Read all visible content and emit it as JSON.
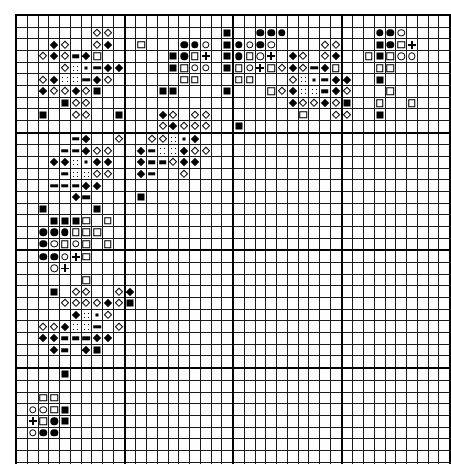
{
  "chart_data": {
    "type": "heatmap",
    "title": "",
    "xlabel": "",
    "ylabel": "",
    "grid": {
      "columns": 40,
      "rows": 40,
      "cell_px": 10.55,
      "major_rule_every": 10
    },
    "legend": [
      {
        "key": "fsq",
        "symbol_name": "filled-square",
        "glyph": "■"
      },
      {
        "key": "osq",
        "symbol_name": "open-square",
        "glyph": "□"
      },
      {
        "key": "fci",
        "symbol_name": "filled-circle",
        "glyph": "●"
      },
      {
        "key": "oci",
        "symbol_name": "open-circle",
        "glyph": "○"
      },
      {
        "key": "fdi",
        "symbol_name": "filled-diamond",
        "glyph": "◆"
      },
      {
        "key": "odi",
        "symbol_name": "open-diamond",
        "glyph": "◇"
      },
      {
        "key": "bar",
        "symbol_name": "horizontal-bar",
        "glyph": "▬"
      },
      {
        "key": "dot",
        "symbol_name": "small-dot",
        "glyph": "·"
      },
      {
        "key": "plu",
        "symbol_name": "plus-sign",
        "glyph": "+"
      },
      {
        "key": "stp",
        "symbol_name": "stippled-square",
        "glyph": "∷"
      }
    ],
    "cells": [
      {
        "r": 1,
        "c": 7,
        "s": "odi"
      },
      {
        "r": 1,
        "c": 8,
        "s": "odi"
      },
      {
        "r": 1,
        "c": 19,
        "s": "fsq"
      },
      {
        "r": 1,
        "c": 22,
        "s": "fci"
      },
      {
        "r": 1,
        "c": 23,
        "s": "fci"
      },
      {
        "r": 1,
        "c": 24,
        "s": "fci"
      },
      {
        "r": 1,
        "c": 33,
        "s": "fci"
      },
      {
        "r": 1,
        "c": 34,
        "s": "fci"
      },
      {
        "r": 1,
        "c": 35,
        "s": "oci"
      },
      {
        "r": 2,
        "c": 3,
        "s": "fdi"
      },
      {
        "r": 2,
        "c": 4,
        "s": "odi"
      },
      {
        "r": 2,
        "c": 7,
        "s": "odi"
      },
      {
        "r": 2,
        "c": 8,
        "s": "fdi"
      },
      {
        "r": 2,
        "c": 11,
        "s": "osq"
      },
      {
        "r": 2,
        "c": 15,
        "s": "fci"
      },
      {
        "r": 2,
        "c": 16,
        "s": "fci"
      },
      {
        "r": 2,
        "c": 17,
        "s": "oci"
      },
      {
        "r": 2,
        "c": 19,
        "s": "fsq"
      },
      {
        "r": 2,
        "c": 20,
        "s": "fci"
      },
      {
        "r": 2,
        "c": 21,
        "s": "oci"
      },
      {
        "r": 2,
        "c": 22,
        "s": "fci"
      },
      {
        "r": 2,
        "c": 23,
        "s": "oci"
      },
      {
        "r": 2,
        "c": 28,
        "s": "odi"
      },
      {
        "r": 2,
        "c": 29,
        "s": "odi"
      },
      {
        "r": 2,
        "c": 33,
        "s": "fsq"
      },
      {
        "r": 2,
        "c": 34,
        "s": "fci"
      },
      {
        "r": 2,
        "c": 35,
        "s": "osq"
      },
      {
        "r": 2,
        "c": 36,
        "s": "plu"
      },
      {
        "r": 3,
        "c": 2,
        "s": "odi"
      },
      {
        "r": 3,
        "c": 3,
        "s": "fdi"
      },
      {
        "r": 3,
        "c": 4,
        "s": "odi"
      },
      {
        "r": 3,
        "c": 5,
        "s": "bar"
      },
      {
        "r": 3,
        "c": 6,
        "s": "fdi"
      },
      {
        "r": 3,
        "c": 7,
        "s": "osq"
      },
      {
        "r": 3,
        "c": 14,
        "s": "fsq"
      },
      {
        "r": 3,
        "c": 15,
        "s": "fci"
      },
      {
        "r": 3,
        "c": 16,
        "s": "osq"
      },
      {
        "r": 3,
        "c": 17,
        "s": "plu"
      },
      {
        "r": 3,
        "c": 19,
        "s": "fsq"
      },
      {
        "r": 3,
        "c": 20,
        "s": "fci"
      },
      {
        "r": 3,
        "c": 21,
        "s": "osq"
      },
      {
        "r": 3,
        "c": 22,
        "s": "oci"
      },
      {
        "r": 3,
        "c": 23,
        "s": "plu"
      },
      {
        "r": 3,
        "c": 25,
        "s": "fdi"
      },
      {
        "r": 3,
        "c": 26,
        "s": "odi"
      },
      {
        "r": 3,
        "c": 28,
        "s": "odi"
      },
      {
        "r": 3,
        "c": 29,
        "s": "fdi"
      },
      {
        "r": 3,
        "c": 32,
        "s": "osq"
      },
      {
        "r": 3,
        "c": 33,
        "s": "fsq"
      },
      {
        "r": 3,
        "c": 34,
        "s": "osq"
      },
      {
        "r": 3,
        "c": 35,
        "s": "oci"
      },
      {
        "r": 3,
        "c": 36,
        "s": "oci"
      },
      {
        "r": 4,
        "c": 4,
        "s": "odi"
      },
      {
        "r": 4,
        "c": 5,
        "s": "stp"
      },
      {
        "r": 4,
        "c": 6,
        "s": "dot"
      },
      {
        "r": 4,
        "c": 7,
        "s": "bar"
      },
      {
        "r": 4,
        "c": 8,
        "s": "fdi"
      },
      {
        "r": 4,
        "c": 9,
        "s": "fdi"
      },
      {
        "r": 4,
        "c": 14,
        "s": "fsq"
      },
      {
        "r": 4,
        "c": 15,
        "s": "osq"
      },
      {
        "r": 4,
        "c": 16,
        "s": "oci"
      },
      {
        "r": 4,
        "c": 17,
        "s": "oci"
      },
      {
        "r": 4,
        "c": 19,
        "s": "fsq"
      },
      {
        "r": 4,
        "c": 20,
        "s": "osq"
      },
      {
        "r": 4,
        "c": 21,
        "s": "oci"
      },
      {
        "r": 4,
        "c": 22,
        "s": "plu"
      },
      {
        "r": 4,
        "c": 23,
        "s": "osq"
      },
      {
        "r": 4,
        "c": 24,
        "s": "odi"
      },
      {
        "r": 4,
        "c": 25,
        "s": "fdi"
      },
      {
        "r": 4,
        "c": 26,
        "s": "odi"
      },
      {
        "r": 4,
        "c": 27,
        "s": "bar"
      },
      {
        "r": 4,
        "c": 28,
        "s": "fdi"
      },
      {
        "r": 4,
        "c": 29,
        "s": "osq"
      },
      {
        "r": 4,
        "c": 33,
        "s": "osq"
      },
      {
        "r": 4,
        "c": 34,
        "s": "osq"
      },
      {
        "r": 5,
        "c": 2,
        "s": "odi"
      },
      {
        "r": 5,
        "c": 3,
        "s": "fdi"
      },
      {
        "r": 5,
        "c": 4,
        "s": "stp"
      },
      {
        "r": 5,
        "c": 5,
        "s": "stp"
      },
      {
        "r": 5,
        "c": 6,
        "s": "bar"
      },
      {
        "r": 5,
        "c": 7,
        "s": "fdi"
      },
      {
        "r": 5,
        "c": 8,
        "s": "odi"
      },
      {
        "r": 5,
        "c": 15,
        "s": "osq"
      },
      {
        "r": 5,
        "c": 16,
        "s": "osq"
      },
      {
        "r": 5,
        "c": 20,
        "s": "osq"
      },
      {
        "r": 5,
        "c": 21,
        "s": "osq"
      },
      {
        "r": 5,
        "c": 25,
        "s": "odi"
      },
      {
        "r": 5,
        "c": 26,
        "s": "stp"
      },
      {
        "r": 5,
        "c": 27,
        "s": "dot"
      },
      {
        "r": 5,
        "c": 28,
        "s": "bar"
      },
      {
        "r": 5,
        "c": 29,
        "s": "fdi"
      },
      {
        "r": 5,
        "c": 30,
        "s": "fdi"
      },
      {
        "r": 5,
        "c": 33,
        "s": "fsq"
      },
      {
        "r": 6,
        "c": 2,
        "s": "fdi"
      },
      {
        "r": 6,
        "c": 3,
        "s": "odi"
      },
      {
        "r": 6,
        "c": 4,
        "s": "odi"
      },
      {
        "r": 6,
        "c": 5,
        "s": "fdi"
      },
      {
        "r": 6,
        "c": 6,
        "s": "odi"
      },
      {
        "r": 6,
        "c": 7,
        "s": "fsq"
      },
      {
        "r": 6,
        "c": 13,
        "s": "fsq"
      },
      {
        "r": 6,
        "c": 14,
        "s": "fsq"
      },
      {
        "r": 6,
        "c": 19,
        "s": "fsq"
      },
      {
        "r": 6,
        "c": 23,
        "s": "osq"
      },
      {
        "r": 6,
        "c": 24,
        "s": "odi"
      },
      {
        "r": 6,
        "c": 25,
        "s": "fdi"
      },
      {
        "r": 6,
        "c": 26,
        "s": "stp"
      },
      {
        "r": 6,
        "c": 27,
        "s": "stp"
      },
      {
        "r": 6,
        "c": 28,
        "s": "bar"
      },
      {
        "r": 6,
        "c": 29,
        "s": "fdi"
      },
      {
        "r": 6,
        "c": 30,
        "s": "odi"
      },
      {
        "r": 6,
        "c": 34,
        "s": "osq"
      },
      {
        "r": 7,
        "c": 4,
        "s": "fsq"
      },
      {
        "r": 7,
        "c": 5,
        "s": "odi"
      },
      {
        "r": 7,
        "c": 6,
        "s": "odi"
      },
      {
        "r": 7,
        "c": 25,
        "s": "fdi"
      },
      {
        "r": 7,
        "c": 26,
        "s": "odi"
      },
      {
        "r": 7,
        "c": 27,
        "s": "odi"
      },
      {
        "r": 7,
        "c": 28,
        "s": "fdi"
      },
      {
        "r": 7,
        "c": 29,
        "s": "odi"
      },
      {
        "r": 7,
        "c": 30,
        "s": "fsq"
      },
      {
        "r": 7,
        "c": 33,
        "s": "osq"
      },
      {
        "r": 7,
        "c": 36,
        "s": "osq"
      },
      {
        "r": 8,
        "c": 2,
        "s": "fsq"
      },
      {
        "r": 8,
        "c": 5,
        "s": "odi"
      },
      {
        "r": 8,
        "c": 6,
        "s": "odi"
      },
      {
        "r": 8,
        "c": 9,
        "s": "fsq"
      },
      {
        "r": 8,
        "c": 13,
        "s": "fdi"
      },
      {
        "r": 8,
        "c": 14,
        "s": "odi"
      },
      {
        "r": 8,
        "c": 16,
        "s": "odi"
      },
      {
        "r": 8,
        "c": 17,
        "s": "odi"
      },
      {
        "r": 8,
        "c": 26,
        "s": "osq"
      },
      {
        "r": 8,
        "c": 29,
        "s": "odi"
      },
      {
        "r": 8,
        "c": 30,
        "s": "odi"
      },
      {
        "r": 8,
        "c": 33,
        "s": "fsq"
      },
      {
        "r": 9,
        "c": 13,
        "s": "odi"
      },
      {
        "r": 9,
        "c": 14,
        "s": "fdi"
      },
      {
        "r": 9,
        "c": 15,
        "s": "odi"
      },
      {
        "r": 9,
        "c": 16,
        "s": "odi"
      },
      {
        "r": 9,
        "c": 17,
        "s": "odi"
      },
      {
        "r": 9,
        "c": 20,
        "s": "fsq"
      },
      {
        "r": 10,
        "c": 5,
        "s": "bar"
      },
      {
        "r": 10,
        "c": 6,
        "s": "fdi"
      },
      {
        "r": 10,
        "c": 9,
        "s": "odi"
      },
      {
        "r": 10,
        "c": 12,
        "s": "odi"
      },
      {
        "r": 10,
        "c": 13,
        "s": "odi"
      },
      {
        "r": 10,
        "c": 14,
        "s": "stp"
      },
      {
        "r": 10,
        "c": 15,
        "s": "dot"
      },
      {
        "r": 10,
        "c": 16,
        "s": "fdi"
      },
      {
        "r": 11,
        "c": 4,
        "s": "bar"
      },
      {
        "r": 11,
        "c": 5,
        "s": "bar"
      },
      {
        "r": 11,
        "c": 6,
        "s": "fdi"
      },
      {
        "r": 11,
        "c": 7,
        "s": "odi"
      },
      {
        "r": 11,
        "c": 8,
        "s": "odi"
      },
      {
        "r": 11,
        "c": 11,
        "s": "fdi"
      },
      {
        "r": 11,
        "c": 12,
        "s": "bar"
      },
      {
        "r": 11,
        "c": 13,
        "s": "stp"
      },
      {
        "r": 11,
        "c": 14,
        "s": "stp"
      },
      {
        "r": 11,
        "c": 15,
        "s": "fdi"
      },
      {
        "r": 11,
        "c": 16,
        "s": "odi"
      },
      {
        "r": 11,
        "c": 17,
        "s": "odi"
      },
      {
        "r": 12,
        "c": 3,
        "s": "fdi"
      },
      {
        "r": 12,
        "c": 4,
        "s": "fdi"
      },
      {
        "r": 12,
        "c": 5,
        "s": "stp"
      },
      {
        "r": 12,
        "c": 6,
        "s": "dot"
      },
      {
        "r": 12,
        "c": 7,
        "s": "fdi"
      },
      {
        "r": 12,
        "c": 8,
        "s": "fdi"
      },
      {
        "r": 12,
        "c": 11,
        "s": "fdi"
      },
      {
        "r": 12,
        "c": 12,
        "s": "bar"
      },
      {
        "r": 12,
        "c": 13,
        "s": "bar"
      },
      {
        "r": 12,
        "c": 14,
        "s": "odi"
      },
      {
        "r": 12,
        "c": 15,
        "s": "fdi"
      },
      {
        "r": 12,
        "c": 16,
        "s": "fdi"
      },
      {
        "r": 13,
        "c": 4,
        "s": "bar"
      },
      {
        "r": 13,
        "c": 5,
        "s": "stp"
      },
      {
        "r": 13,
        "c": 6,
        "s": "stp"
      },
      {
        "r": 13,
        "c": 7,
        "s": "odi"
      },
      {
        "r": 13,
        "c": 8,
        "s": "odi"
      },
      {
        "r": 13,
        "c": 11,
        "s": "fdi"
      },
      {
        "r": 13,
        "c": 12,
        "s": "bar"
      },
      {
        "r": 13,
        "c": 15,
        "s": "odi"
      },
      {
        "r": 14,
        "c": 3,
        "s": "bar"
      },
      {
        "r": 14,
        "c": 4,
        "s": "bar"
      },
      {
        "r": 14,
        "c": 5,
        "s": "bar"
      },
      {
        "r": 14,
        "c": 6,
        "s": "fdi"
      },
      {
        "r": 14,
        "c": 7,
        "s": "fdi"
      },
      {
        "r": 15,
        "c": 5,
        "s": "fdi"
      },
      {
        "r": 15,
        "c": 6,
        "s": "bar"
      },
      {
        "r": 15,
        "c": 11,
        "s": "fsq"
      },
      {
        "r": 16,
        "c": 2,
        "s": "fsq"
      },
      {
        "r": 16,
        "c": 7,
        "s": "fsq"
      },
      {
        "r": 17,
        "c": 3,
        "s": "fsq"
      },
      {
        "r": 17,
        "c": 4,
        "s": "fsq"
      },
      {
        "r": 17,
        "c": 5,
        "s": "fsq"
      },
      {
        "r": 17,
        "c": 6,
        "s": "osq"
      },
      {
        "r": 17,
        "c": 8,
        "s": "osq"
      },
      {
        "r": 18,
        "c": 2,
        "s": "fci"
      },
      {
        "r": 18,
        "c": 3,
        "s": "fci"
      },
      {
        "r": 18,
        "c": 4,
        "s": "fci"
      },
      {
        "r": 18,
        "c": 5,
        "s": "osq"
      },
      {
        "r": 18,
        "c": 6,
        "s": "osq"
      },
      {
        "r": 18,
        "c": 7,
        "s": "osq"
      },
      {
        "r": 19,
        "c": 2,
        "s": "fci"
      },
      {
        "r": 19,
        "c": 3,
        "s": "oci"
      },
      {
        "r": 19,
        "c": 4,
        "s": "osq"
      },
      {
        "r": 19,
        "c": 5,
        "s": "oci"
      },
      {
        "r": 19,
        "c": 6,
        "s": "osq"
      },
      {
        "r": 19,
        "c": 8,
        "s": "osq"
      },
      {
        "r": 20,
        "c": 2,
        "s": "fci"
      },
      {
        "r": 20,
        "c": 3,
        "s": "fci"
      },
      {
        "r": 20,
        "c": 4,
        "s": "oci"
      },
      {
        "r": 20,
        "c": 5,
        "s": "plu"
      },
      {
        "r": 20,
        "c": 6,
        "s": "osq"
      },
      {
        "r": 21,
        "c": 3,
        "s": "oci"
      },
      {
        "r": 21,
        "c": 4,
        "s": "plu"
      },
      {
        "r": 22,
        "c": 6,
        "s": "osq"
      },
      {
        "r": 23,
        "c": 3,
        "s": "fsq"
      },
      {
        "r": 23,
        "c": 5,
        "s": "odi"
      },
      {
        "r": 23,
        "c": 6,
        "s": "odi"
      },
      {
        "r": 23,
        "c": 9,
        "s": "odi"
      },
      {
        "r": 23,
        "c": 10,
        "s": "fdi"
      },
      {
        "r": 24,
        "c": 4,
        "s": "odi"
      },
      {
        "r": 24,
        "c": 5,
        "s": "odi"
      },
      {
        "r": 24,
        "c": 6,
        "s": "odi"
      },
      {
        "r": 24,
        "c": 7,
        "s": "odi"
      },
      {
        "r": 24,
        "c": 8,
        "s": "fdi"
      },
      {
        "r": 24,
        "c": 9,
        "s": "odi"
      },
      {
        "r": 24,
        "c": 10,
        "s": "fsq"
      },
      {
        "r": 25,
        "c": 5,
        "s": "fdi"
      },
      {
        "r": 25,
        "c": 6,
        "s": "stp"
      },
      {
        "r": 25,
        "c": 7,
        "s": "dot"
      },
      {
        "r": 25,
        "c": 8,
        "s": "odi"
      },
      {
        "r": 26,
        "c": 2,
        "s": "odi"
      },
      {
        "r": 26,
        "c": 3,
        "s": "odi"
      },
      {
        "r": 26,
        "c": 4,
        "s": "fdi"
      },
      {
        "r": 26,
        "c": 5,
        "s": "stp"
      },
      {
        "r": 26,
        "c": 6,
        "s": "stp"
      },
      {
        "r": 26,
        "c": 7,
        "s": "bar"
      },
      {
        "r": 26,
        "c": 9,
        "s": "odi"
      },
      {
        "r": 27,
        "c": 2,
        "s": "fdi"
      },
      {
        "r": 27,
        "c": 3,
        "s": "fdi"
      },
      {
        "r": 27,
        "c": 4,
        "s": "bar"
      },
      {
        "r": 27,
        "c": 5,
        "s": "bar"
      },
      {
        "r": 27,
        "c": 6,
        "s": "bar"
      },
      {
        "r": 27,
        "c": 7,
        "s": "fdi"
      },
      {
        "r": 27,
        "c": 8,
        "s": "fdi"
      },
      {
        "r": 28,
        "c": 3,
        "s": "fdi"
      },
      {
        "r": 28,
        "c": 4,
        "s": "bar"
      },
      {
        "r": 28,
        "c": 6,
        "s": "fdi"
      },
      {
        "r": 28,
        "c": 7,
        "s": "fsq"
      },
      {
        "r": 30,
        "c": 4,
        "s": "fsq"
      },
      {
        "r": 32,
        "c": 2,
        "s": "osq"
      },
      {
        "r": 32,
        "c": 3,
        "s": "osq"
      },
      {
        "r": 33,
        "c": 1,
        "s": "oci"
      },
      {
        "r": 33,
        "c": 2,
        "s": "oci"
      },
      {
        "r": 33,
        "c": 3,
        "s": "osq"
      },
      {
        "r": 33,
        "c": 4,
        "s": "fsq"
      },
      {
        "r": 34,
        "c": 1,
        "s": "plu"
      },
      {
        "r": 34,
        "c": 2,
        "s": "osq"
      },
      {
        "r": 34,
        "c": 3,
        "s": "fci"
      },
      {
        "r": 34,
        "c": 4,
        "s": "fsq"
      },
      {
        "r": 35,
        "c": 1,
        "s": "oci"
      },
      {
        "r": 35,
        "c": 2,
        "s": "fci"
      },
      {
        "r": 35,
        "c": 3,
        "s": "fci"
      }
    ]
  }
}
